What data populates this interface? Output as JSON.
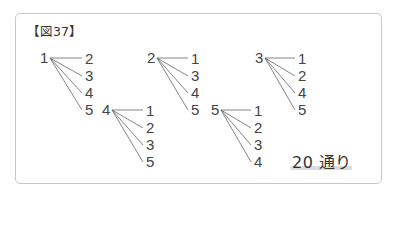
{
  "figure": {
    "label": "【図37】",
    "trees": [
      {
        "root": "1",
        "leaves": [
          "2",
          "3",
          "4",
          "5"
        ]
      },
      {
        "root": "2",
        "leaves": [
          "1",
          "3",
          "4",
          "5"
        ]
      },
      {
        "root": "3",
        "leaves": [
          "1",
          "2",
          "4",
          "5"
        ]
      },
      {
        "root": "4",
        "leaves": [
          "1",
          "2",
          "3",
          "5"
        ]
      },
      {
        "root": "5",
        "leaves": [
          "1",
          "2",
          "3",
          "4"
        ]
      }
    ],
    "result": "20 通り",
    "colors": {
      "text": "#444444",
      "line": "#666666",
      "frame": "#c8c8c8",
      "highlight": "#dcdcdc"
    }
  }
}
